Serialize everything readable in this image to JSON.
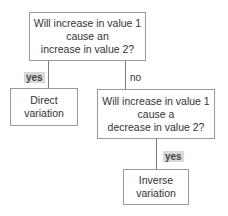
{
  "diagram": {
    "type": "decision-flowchart",
    "nodes": {
      "q1": {
        "lines": [
          "Will increase in value 1",
          "cause an",
          "increase in value 2?"
        ]
      },
      "direct": {
        "lines": [
          "Direct",
          "variation"
        ]
      },
      "q2": {
        "lines": [
          "Will increase in value 1",
          "cause a",
          "decrease in value 2?"
        ]
      },
      "inverse": {
        "lines": [
          "Inverse",
          "variation"
        ]
      }
    },
    "edges": {
      "q1_to_direct": "yes",
      "q1_to_q2": "no",
      "q2_to_inverse": "yes"
    },
    "colors": {
      "border": "#9a9a9a",
      "line": "#7a7a7a",
      "label_highlight": "#d9d9d9"
    }
  }
}
